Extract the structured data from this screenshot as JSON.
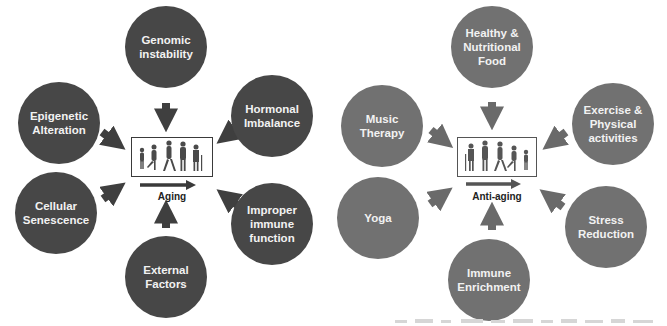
{
  "aging_panel": {
    "center_label": "Aging",
    "factors": [
      {
        "id": "genomic",
        "label": "Genomic\ninstability"
      },
      {
        "id": "hormonal",
        "label": "Hormonal\nImbalance"
      },
      {
        "id": "epigenetic",
        "label": "Epigenetic\nAlteration"
      },
      {
        "id": "cellular",
        "label": "Cellular\nSenescence"
      },
      {
        "id": "external",
        "label": "External\nFactors"
      },
      {
        "id": "immune",
        "label": "Improper\nimmune\nfunction"
      }
    ],
    "circle_color": "#474747"
  },
  "anti_aging_panel": {
    "center_label": "Anti-aging",
    "factors": [
      {
        "id": "food",
        "label": "Healthy &\nNutritional\nFood"
      },
      {
        "id": "exercise",
        "label": "Exercise &\nPhysical\nactivities"
      },
      {
        "id": "music",
        "label": "Music\nTherapy"
      },
      {
        "id": "yoga",
        "label": "Yoga"
      },
      {
        "id": "immune",
        "label": "Immune\nEnrichment"
      },
      {
        "id": "stress",
        "label": "Stress\nReduction"
      }
    ],
    "circle_color": "#717171"
  }
}
